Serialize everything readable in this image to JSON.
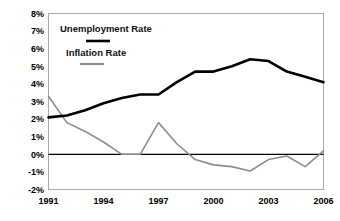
{
  "chart_data": {
    "type": "line",
    "title": "",
    "xlabel": "",
    "ylabel": "",
    "x": [
      1991,
      1992,
      1993,
      1994,
      1995,
      1996,
      1997,
      1998,
      1999,
      2000,
      2001,
      2002,
      2003,
      2004,
      2005,
      2006
    ],
    "xlim": [
      1991,
      2006
    ],
    "ylim": [
      -2,
      8
    ],
    "ytick_labels": [
      "8%",
      "7%",
      "6%",
      "5%",
      "4%",
      "3%",
      "2%",
      "1%",
      "0%",
      "-1%",
      "-2%"
    ],
    "ytick_values": [
      8,
      7,
      6,
      5,
      4,
      3,
      2,
      1,
      0,
      -1,
      -2
    ],
    "xtick_labels": [
      "1991",
      "1994",
      "1997",
      "2000",
      "2003",
      "2006"
    ],
    "xtick_values": [
      1991,
      1994,
      1997,
      2000,
      2003,
      2006
    ],
    "grid": false,
    "zero_line": true,
    "legend_position": "top-left-inside",
    "series": [
      {
        "name": "Unemployment Rate",
        "color": "#000000",
        "values": [
          2.1,
          2.2,
          2.5,
          2.9,
          3.2,
          3.4,
          3.4,
          4.1,
          4.7,
          4.7,
          5.0,
          5.4,
          5.3,
          4.7,
          4.4,
          4.1
        ]
      },
      {
        "name": "Inflation Rate",
        "color": "#8c8c8c",
        "values": [
          3.3,
          1.8,
          1.3,
          0.7,
          0.0,
          0.0,
          1.8,
          0.6,
          -0.3,
          -0.6,
          -0.7,
          -0.95,
          -0.3,
          -0.1,
          -0.7,
          0.2
        ]
      }
    ]
  },
  "legend": {
    "items": [
      {
        "label": "Unemployment Rate",
        "swatch": "line-swatch-black"
      },
      {
        "label": "Inflation Rate",
        "swatch": "line-swatch-gray"
      }
    ]
  },
  "colors": {
    "unemployment": "#000000",
    "inflation": "#8c8c8c",
    "frame": "#a8a8a8",
    "background": "#ffffff",
    "text": "#000000"
  }
}
